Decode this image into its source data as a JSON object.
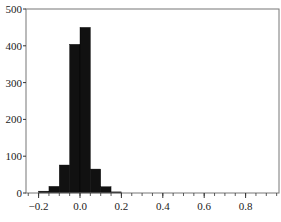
{
  "chart_data": {
    "type": "bar",
    "subtype": "histogram",
    "title": "",
    "xlabel": "",
    "ylabel": "",
    "bin_edges": [
      -0.2,
      -0.15,
      -0.1,
      -0.05,
      0.0,
      0.05,
      0.1,
      0.15,
      0.2
    ],
    "values": [
      5,
      18,
      76,
      404,
      450,
      65,
      17,
      3
    ],
    "xlim": [
      -0.26,
      0.96
    ],
    "ylim": [
      0,
      500
    ],
    "x_ticks": [
      -0.2,
      0.0,
      0.2,
      0.4,
      0.6,
      0.8
    ],
    "x_tick_labels": [
      "−0.2",
      "0.0",
      "0.2",
      "0.4",
      "0.6",
      "0.8"
    ],
    "y_ticks": [
      0,
      100,
      200,
      300,
      400,
      500
    ],
    "y_tick_labels": [
      "0",
      "100",
      "200",
      "300",
      "400",
      "500"
    ],
    "grid": false,
    "legend": null,
    "bar_color": "#111111"
  }
}
